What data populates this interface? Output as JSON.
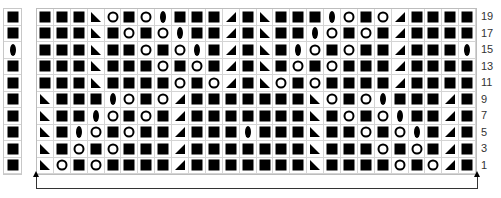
{
  "chart": {
    "title": "",
    "columns": 26,
    "row_labels": [
      "19",
      "17",
      "15",
      "13",
      "11",
      "9",
      "7",
      "5",
      "3",
      "1"
    ],
    "symbol_legend": {
      "S": "filled-square",
      "O": "open-circle",
      "D": "diamond",
      "L": "triangle-left",
      "R": "triangle-right"
    },
    "edge_column": [
      "S",
      "S",
      "D",
      "S",
      "S",
      "S",
      "S",
      "S",
      "S",
      "S"
    ],
    "rows": [
      "SSSLOSODSSSRSLSSSDOSORSSSS",
      "SSSLSOSODSSRSLSSDOSOSRSSSS",
      "SSSLSSOSODSRSLSDOSOSSRSSSD",
      "SSSLSSSOSOSRSLSOSOSSSRSSSS",
      "SSSLSSSSOSORSLOSOSSSSRSSSS",
      "LSSSDOSORSSSSSSSLOSODSSSRS",
      "LSSDOSOSRSSSSSSSLSOSODSSRS",
      "LSDOSOSSRSSSDSSSLSSOSODSRS",
      "LSOSOSSSRSSSSSSSLSSSOSOSRS",
      "LOSOSSSSRSSSSSSSLSSSSOSORS"
    ],
    "repeat_bracket": {
      "from_column": 1,
      "to_column": 26
    }
  }
}
